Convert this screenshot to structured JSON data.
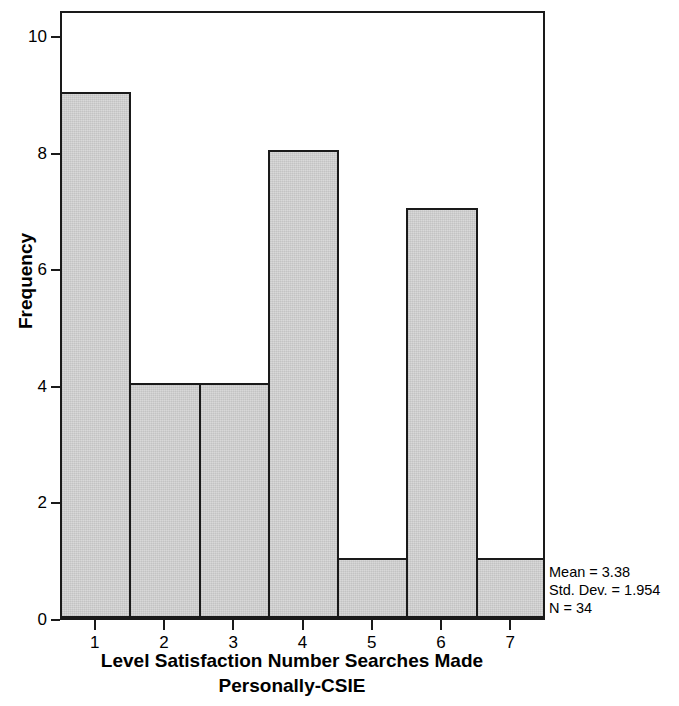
{
  "chart_data": {
    "type": "bar",
    "title": "",
    "subtitle": "",
    "xlabel_line1": "Level Satisfaction Number Searches Made",
    "xlabel_line2": "Personally-CSIE",
    "ylabel": "Frequency",
    "categories": [
      "1",
      "2",
      "3",
      "4",
      "5",
      "6",
      "7"
    ],
    "values": [
      9,
      4,
      4,
      8,
      1,
      7,
      1
    ],
    "series": [
      {
        "name": "Frequency",
        "values": [
          9,
          4,
          4,
          8,
          1,
          7,
          1
        ]
      }
    ],
    "xlim": [
      0.5,
      7.5
    ],
    "ylim": [
      0,
      10.45
    ],
    "ytick_labels": [
      "0",
      "2",
      "4",
      "6",
      "8",
      "10"
    ],
    "ytick_values": [
      0,
      2,
      4,
      6,
      8,
      10
    ],
    "xtick_labels": [
      "1",
      "2",
      "3",
      "4",
      "5",
      "6",
      "7"
    ],
    "xtick_values": [
      1,
      2,
      3,
      4,
      5,
      6,
      7
    ],
    "grid": false,
    "legend": false,
    "legend_position": "none",
    "bar_fill_color": "#d4d4d4",
    "bar_edge_color": "#1a1a1a",
    "frame_color": "#1a1a1a",
    "background_color": "#ffffff",
    "annotations": [
      "Mean = 3.38",
      "Std. Dev. = 1.954",
      "N = 34"
    ]
  },
  "stats": {
    "mean_label": "Mean = 3.38",
    "stddev_label": "Std. Dev. = 1.954",
    "n_label": "N = 34"
  },
  "axes": {
    "y_title": "Frequency",
    "x_title_line1": "Level Satisfaction Number Searches Made",
    "x_title_line2": "Personally-CSIE"
  }
}
